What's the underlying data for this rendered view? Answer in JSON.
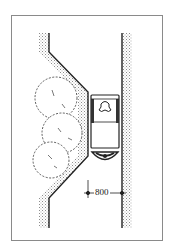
{
  "diagram": {
    "type": "architectural-plan",
    "dimension": {
      "label": "800",
      "unit": "mm"
    },
    "elements": [
      "left-wall-with-narrowing",
      "right-wall",
      "shrubs",
      "wheelchair-user",
      "dimension-line"
    ],
    "colors": {
      "line": "#222222",
      "stipple": "#9a9a9a",
      "frame": "#8a8a8a",
      "background": "#ffffff"
    }
  }
}
